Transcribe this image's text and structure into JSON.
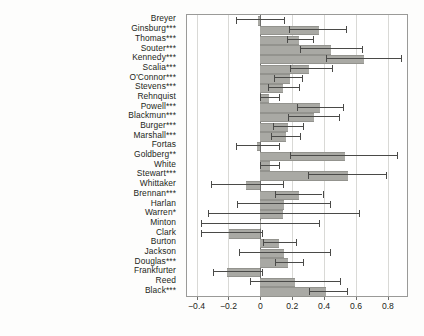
{
  "chart_data": {
    "type": "bar",
    "orientation": "horizontal",
    "title": "",
    "xlabel": "",
    "ylabel": "",
    "xlim": [
      -0.46,
      0.92
    ],
    "ylim": [
      0,
      25
    ],
    "grid": true,
    "legend": null,
    "error_bars": "horizontal confidence intervals",
    "xticks": [
      -0.4,
      -0.2,
      0,
      0.2,
      0.4,
      0.6,
      0.8
    ],
    "xticklabels": [
      "−0.4",
      "−0.2",
      "0",
      "0.2",
      "0.4",
      "0.6",
      "0.8"
    ],
    "bar_color": "#a9a9a4",
    "ci_color": "#4a4a48",
    "categories": [
      "Breyer",
      "Ginsburg***",
      "Thomas***",
      "Souter***",
      "Kennedy***",
      "Scalia***",
      "O'Connor***",
      "Stevens***",
      "Rehnquist",
      "Powell***",
      "Blackmun***",
      "Burger***",
      "Marshall***",
      "Fortas",
      "Goldberg**",
      "White",
      "Stewart***",
      "Whittaker",
      "Brennan***",
      "Harlan",
      "Warren*",
      "Minton",
      "Clark",
      "Burton",
      "Jackson",
      "Douglas***",
      "Frankfurter",
      "Reed",
      "Black***"
    ],
    "values": [
      -0.015,
      0.365,
      0.245,
      0.445,
      0.65,
      0.305,
      0.185,
      0.145,
      0.055,
      0.375,
      0.335,
      0.175,
      0.16,
      -0.02,
      0.53,
      0.06,
      0.55,
      -0.09,
      0.24,
      0.15,
      0.145,
      0.0,
      -0.195,
      0.12,
      0.15,
      0.175,
      -0.21,
      0.215,
      0.415
    ],
    "ci_low": [
      -0.155,
      0.18,
      0.17,
      0.25,
      0.415,
      0.185,
      0.085,
      0.05,
      0.0,
      0.23,
      0.175,
      0.08,
      0.07,
      -0.155,
      0.185,
      0.0,
      0.3,
      -0.31,
      0.095,
      -0.145,
      -0.33,
      -0.37,
      -0.37,
      0.015,
      -0.135,
      0.09,
      -0.3,
      -0.065,
      0.305
    ],
    "ci_high": [
      0.15,
      0.54,
      0.33,
      0.64,
      0.88,
      0.45,
      0.26,
      0.245,
      0.12,
      0.52,
      0.495,
      0.27,
      0.25,
      0.115,
      0.86,
      0.12,
      0.79,
      0.14,
      0.39,
      0.44,
      0.62,
      0.37,
      0.01,
      0.225,
      0.44,
      0.265,
      0.01,
      0.5,
      0.545
    ]
  }
}
